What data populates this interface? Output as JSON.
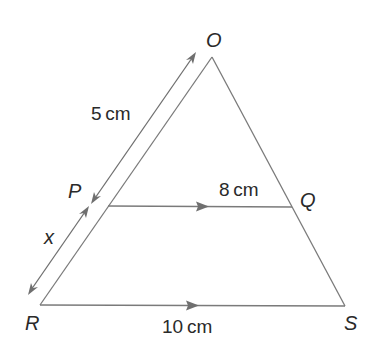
{
  "figure": {
    "type": "similar-triangles geometry diagram",
    "vertices": {
      "O": "O",
      "P": "P",
      "Q": "Q",
      "R": "R",
      "S": "S"
    },
    "measurements": {
      "OP": "5 cm",
      "PR": "x",
      "PQ": "8 cm",
      "RS": "10 cm"
    },
    "parallel_marks": [
      "PQ",
      "RS"
    ],
    "colors": {
      "lines": "#7a7a7a",
      "text": "#2a2a2a",
      "background": "#ffffff"
    }
  }
}
